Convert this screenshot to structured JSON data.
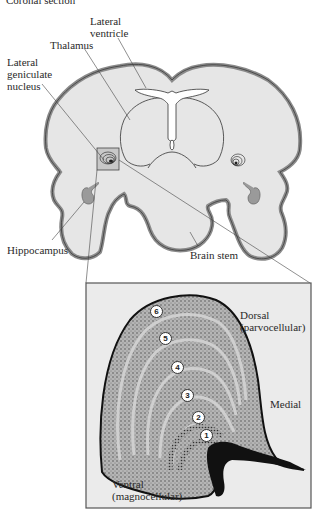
{
  "figure": {
    "header_partial": "Coronal section",
    "upper_panel": {
      "labels": {
        "lateral_ventricle": [
          "Lateral",
          "ventricle"
        ],
        "thalamus": "Thalamus",
        "lateral_geniculate_nucleus": [
          "Lateral",
          "geniculate",
          "nucleus"
        ],
        "hippocampus": "Hippocampus",
        "brain_stem": "Brain stem"
      }
    },
    "inset_panel": {
      "labels": {
        "dorsal": [
          "Dorsal",
          "(parvocellular)"
        ],
        "medial": "Medial",
        "ventral": [
          "Ventral",
          "(magnocellular)"
        ]
      },
      "layers": [
        "6",
        "5",
        "4",
        "3",
        "2",
        "1"
      ]
    },
    "colors": {
      "tissue_fill": "#e8e8e8",
      "cortex_band": "#8c8c8c",
      "outline": "#3a3a3a",
      "inset_bg": "#ececec",
      "layer_fill": "#b9b9b9"
    }
  }
}
